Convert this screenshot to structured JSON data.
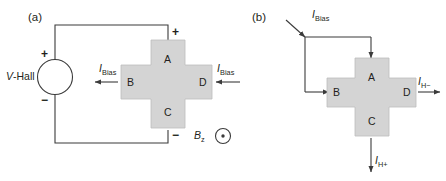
{
  "figure": {
    "panels": [
      {
        "id": "a",
        "label": "(a)",
        "source": {
          "name": "V-Hall",
          "italic_part": "V",
          "rest_part": "-Hall",
          "plus": "+",
          "minus": "−"
        },
        "cross_contacts": {
          "top": "A",
          "left": "B",
          "bottom": "C",
          "right": "D"
        },
        "terminal_signs": {
          "top": "+",
          "bottom": "−"
        },
        "currents": [
          {
            "name": "current-left",
            "symbol": "I",
            "subscript": "Bias"
          },
          {
            "name": "current-right",
            "symbol": "I",
            "subscript": "Bias"
          }
        ],
        "field": {
          "symbol": "B",
          "subscript": "z",
          "direction_icon": "circle-dot-out-of-page"
        }
      },
      {
        "id": "b",
        "label": "(b)",
        "cross_contacts": {
          "top": "A",
          "left": "B",
          "bottom": "C",
          "right": "D"
        },
        "currents": [
          {
            "name": "current-bias",
            "symbol": "I",
            "subscript": "Bias"
          },
          {
            "name": "current-hall-minus",
            "symbol": "I",
            "subscript": "H−"
          },
          {
            "name": "current-hall-plus",
            "symbol": "I",
            "subscript": "H+"
          }
        ]
      }
    ],
    "colors": {
      "device_fill": "#d4d4d4",
      "device_stroke": "#bdbdbd",
      "line": "#3b3b3b",
      "text": "#231f20",
      "background": "#ffffff"
    }
  }
}
